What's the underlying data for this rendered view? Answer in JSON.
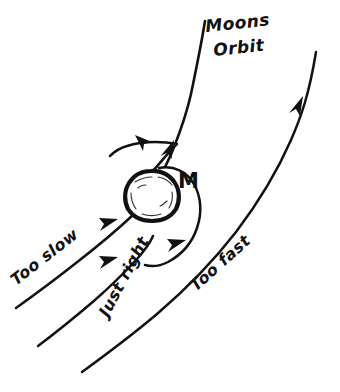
{
  "figure": {
    "title_label": "Moons Orbit",
    "central_body_label": "M",
    "background_color": "#ffffff",
    "ink_color": "#111111",
    "style": "hand-drawn ink sketch",
    "trajectories": [
      {
        "id": "too-slow",
        "label": "Too slow",
        "label_rotation": -38,
        "label_x": 16,
        "label_y": 286,
        "outcome": "falls into the planet"
      },
      {
        "id": "just-right",
        "label": "Just right",
        "label_rotation": -62,
        "label_x": 108,
        "label_y": 318,
        "outcome": "enters closed orbit"
      },
      {
        "id": "too-fast",
        "label": "Too fast",
        "label_rotation": -42,
        "label_x": 196,
        "label_y": 292,
        "outcome": "escapes past the planet"
      }
    ],
    "moons_orbit": {
      "line_1": "Moons",
      "line_2": "Orbit",
      "line_1_x": 206,
      "line_1_y": 32,
      "line_2_x": 214,
      "line_2_y": 56,
      "rotation": -6
    },
    "central_body": {
      "label": "M",
      "label_x": 178,
      "label_y": 188,
      "center_x": 151,
      "center_y": 194,
      "radius": 23
    }
  }
}
